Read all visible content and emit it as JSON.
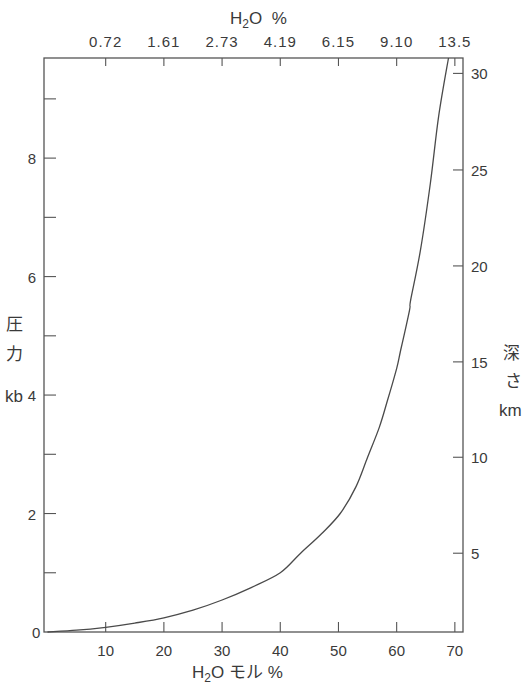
{
  "chart_data": {
    "type": "line",
    "title": "",
    "xlabel": "H2O モル %",
    "xlabel_parts": {
      "prefix": "H",
      "sub": "2",
      "suffix": "O モル %"
    },
    "ylabel_left": {
      "line1": "圧",
      "line2": "力",
      "unit": "kb"
    },
    "ylabel_right": {
      "line1": "深",
      "line2": "さ",
      "unit": "km"
    },
    "top_label_parts": {
      "prefix": "H",
      "sub": "2",
      "suffix": "O  %"
    },
    "xlim": [
      -0.6,
      71.4
    ],
    "ylim": [
      0,
      9.69
    ],
    "x_ticks": [
      10,
      20,
      30,
      40,
      50,
      60,
      70
    ],
    "x_tick_labels": [
      "10",
      "20",
      "30",
      "40",
      "50",
      "60",
      "70"
    ],
    "x_zero_label": "0",
    "top_ticks": [
      10,
      20,
      30,
      40,
      50,
      60,
      70
    ],
    "top_tick_labels": [
      "0.72",
      "1.61",
      "2.73",
      "4.19",
      "6.15",
      "9.10",
      "13.5"
    ],
    "y_ticks": [
      0,
      1,
      2,
      3,
      4,
      5,
      6,
      7,
      8,
      9
    ],
    "y_tick_labels": {
      "2": "2",
      "4": "4",
      "6": "6",
      "8": "8"
    },
    "right_ticks_kb": [
      1.33,
      2.95,
      4.56,
      6.18,
      7.8,
      9.43
    ],
    "right_tick_labels": [
      "5",
      "10",
      "15",
      "20",
      "25",
      "30"
    ],
    "grid": false,
    "legend": "none",
    "series": [
      {
        "name": "H2O solubility vs pressure",
        "x": [
          0,
          5,
          10,
          15,
          20,
          25,
          30,
          35,
          40,
          43.5,
          47,
          50.3,
          53,
          55,
          57,
          58.4,
          60,
          60.7,
          62.2,
          62.4,
          64.1,
          65.8,
          67.2,
          68.9
        ],
        "y": [
          0,
          0.03,
          0.08,
          0.15,
          0.24,
          0.37,
          0.54,
          0.75,
          1.0,
          1.33,
          1.65,
          2.0,
          2.45,
          2.95,
          3.45,
          3.9,
          4.45,
          4.76,
          5.43,
          5.6,
          6.45,
          7.58,
          8.7,
          9.69
        ]
      }
    ],
    "colors": {
      "line": "#4a4a4a",
      "frame": "#555555",
      "text": "#3a3a3a"
    }
  }
}
